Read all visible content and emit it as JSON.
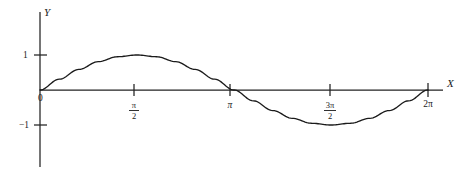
{
  "figure": {
    "title": "",
    "background_color": "#ffffff",
    "ink_color": "#1a1a1a"
  },
  "axes": {
    "x_axis_label": "X",
    "y_axis_label": "Y",
    "origin_label": "0"
  },
  "x_ticks": [
    {
      "label": "0",
      "value": 0,
      "kind": "plain",
      "px": 40
    },
    {
      "label": "π/2",
      "numerator": "π",
      "denominator": "2",
      "value": 1.5708,
      "kind": "fraction",
      "px": 134
    },
    {
      "label": "π",
      "value": 3.1416,
      "kind": "plain",
      "px": 230
    },
    {
      "label": "3π/2",
      "numerator": "3π",
      "denominator": "2",
      "value": 4.7124,
      "kind": "fraction",
      "px": 330
    },
    {
      "label": "2π",
      "value": 6.2832,
      "kind": "plain",
      "px": 428
    }
  ],
  "y_ticks": [
    {
      "label": "1",
      "value": 1,
      "px": 55
    },
    {
      "label": "−1",
      "value": -1,
      "px": 125
    }
  ],
  "chart_data": {
    "type": "line",
    "title": "",
    "subtitle": "",
    "xlabel": "X",
    "ylabel": "Y",
    "xlim": [
      0,
      6.2832
    ],
    "ylim": [
      -1,
      1
    ],
    "grid": false,
    "legend": null,
    "legend_position": "none",
    "xtick_labels": [
      "0",
      "π/2",
      "π",
      "3π/2",
      "2π"
    ],
    "xtick_values": [
      0,
      1.5708,
      3.1416,
      4.7124,
      6.2832
    ],
    "ytick_labels": [
      "1",
      "−1"
    ],
    "ytick_values": [
      1,
      -1
    ],
    "annotations": [],
    "series": [
      {
        "name": "y = sin x",
        "equation": "y = sin(x)",
        "color": "#1b1b1b",
        "x": [
          0,
          0.3142,
          0.6283,
          0.9425,
          1.2566,
          1.5708,
          1.885,
          2.1991,
          2.5133,
          2.8274,
          3.1416,
          3.4558,
          3.7699,
          4.0841,
          4.3982,
          4.7124,
          5.0265,
          5.3407,
          5.6549,
          5.969,
          6.2832
        ],
        "values": [
          0,
          0.309,
          0.5878,
          0.809,
          0.9511,
          1,
          0.9511,
          0.809,
          0.5878,
          0.309,
          0,
          -0.309,
          -0.5878,
          -0.809,
          -0.9511,
          -1,
          -0.9511,
          -0.809,
          -0.5878,
          -0.309,
          0
        ]
      }
    ]
  }
}
